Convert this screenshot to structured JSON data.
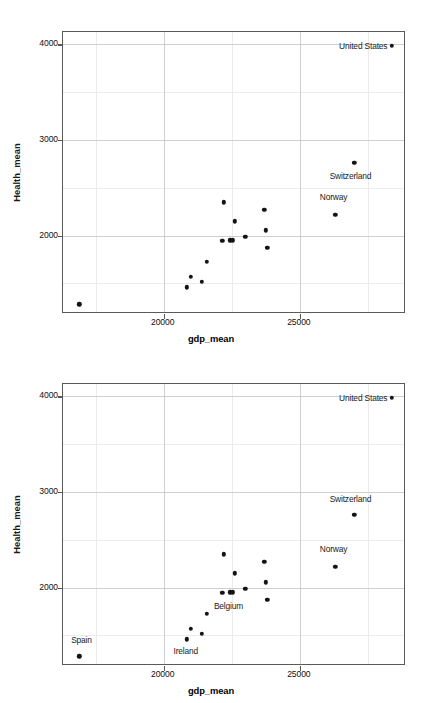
{
  "figure": {
    "panel_count": 2,
    "background": "#ffffff",
    "point_color": "#141414",
    "panel_border_color": "#5a5a5a",
    "grid_major_color": "#cfcfcf",
    "grid_minor_color": "#ebebeb"
  },
  "chart_data": [
    {
      "type": "scatter",
      "title": "",
      "xlabel": "gdp_mean",
      "ylabel": "Health_mean",
      "xlim": [
        16300,
        28900
      ],
      "ylim": [
        1180,
        4130
      ],
      "xticks": [
        20000,
        25000
      ],
      "xtick_labels": [
        "20000",
        "25000"
      ],
      "yticks": [
        2000,
        3000,
        4000
      ],
      "ytick_labels": [
        "2000",
        "3000",
        "4000"
      ],
      "x_minor_gridlines": [
        17500,
        22500,
        27500
      ],
      "y_minor_gridlines": [
        1500,
        2500,
        3500
      ],
      "grid": true,
      "legend": "none",
      "points": [
        {
          "label": "Spain",
          "x": 16900,
          "y": 1280,
          "shown": false,
          "lx": 0,
          "ly": 0
        },
        {
          "label": "Ireland",
          "x": 20840,
          "y": 1460,
          "shown": false,
          "lx": 0,
          "ly": 0
        },
        {
          "label": "Portugal",
          "x": 20990,
          "y": 1570,
          "shown": false,
          "lx": 0,
          "ly": 0
        },
        {
          "label": "Greece",
          "x": 21400,
          "y": 1515,
          "shown": false,
          "lx": 0,
          "ly": 0
        },
        {
          "label": "Italy",
          "x": 21590,
          "y": 1725,
          "shown": false,
          "lx": 0,
          "ly": 0
        },
        {
          "label": "Finland",
          "x": 22150,
          "y": 1945,
          "shown": false,
          "lx": 0,
          "ly": 0
        },
        {
          "label": "Belgium",
          "x": 22440,
          "y": 1950,
          "shown": false,
          "lx": 0,
          "ly": 0
        },
        {
          "label": "Japan",
          "x": 22530,
          "y": 1950,
          "shown": false,
          "lx": 0,
          "ly": 0
        },
        {
          "label": "Luxembourg",
          "x": 22200,
          "y": 2350,
          "shown": false,
          "lx": 0,
          "ly": 0
        },
        {
          "label": "Netherlands",
          "x": 22610,
          "y": 2150,
          "shown": false,
          "lx": 0,
          "ly": 0
        },
        {
          "label": "Austria",
          "x": 23000,
          "y": 1985,
          "shown": false,
          "lx": 0,
          "ly": 0
        },
        {
          "label": "Denmark",
          "x": 23700,
          "y": 2270,
          "shown": false,
          "lx": 0,
          "ly": 0
        },
        {
          "label": "Germany",
          "x": 23740,
          "y": 2055,
          "shown": false,
          "lx": 0,
          "ly": 0
        },
        {
          "label": "Sweden",
          "x": 23800,
          "y": 1870,
          "shown": false,
          "lx": 0,
          "ly": 0
        },
        {
          "label": "Norway",
          "x": 26300,
          "y": 2215,
          "shown": true,
          "lx": 26240,
          "ly": 2400
        },
        {
          "label": "Switzerland",
          "x": 27000,
          "y": 2760,
          "shown": true,
          "lx": 26860,
          "ly": 2620
        },
        {
          "label": "United States",
          "x": 28380,
          "y": 3985,
          "shown": true,
          "lx": 27330,
          "ly": 3985
        }
      ]
    },
    {
      "type": "scatter",
      "title": "",
      "xlabel": "gdp_mean",
      "ylabel": "Health_mean",
      "xlim": [
        16300,
        28900
      ],
      "ylim": [
        1180,
        4130
      ],
      "xticks": [
        20000,
        25000
      ],
      "xtick_labels": [
        "20000",
        "25000"
      ],
      "yticks": [
        2000,
        3000,
        4000
      ],
      "ytick_labels": [
        "2000",
        "3000",
        "4000"
      ],
      "x_minor_gridlines": [
        17500,
        22500,
        27500
      ],
      "y_minor_gridlines": [
        1500,
        2500,
        3500
      ],
      "grid": true,
      "legend": "none",
      "points": [
        {
          "label": "Spain",
          "x": 16900,
          "y": 1280,
          "shown": true,
          "lx": 16980,
          "ly": 1450
        },
        {
          "label": "Ireland",
          "x": 20840,
          "y": 1460,
          "shown": true,
          "lx": 20810,
          "ly": 1335
        },
        {
          "label": "Portugal",
          "x": 20990,
          "y": 1570,
          "shown": false,
          "lx": 0,
          "ly": 0
        },
        {
          "label": "Greece",
          "x": 21400,
          "y": 1515,
          "shown": false,
          "lx": 0,
          "ly": 0
        },
        {
          "label": "Italy",
          "x": 21590,
          "y": 1725,
          "shown": false,
          "lx": 0,
          "ly": 0
        },
        {
          "label": "Finland",
          "x": 22150,
          "y": 1945,
          "shown": false,
          "lx": 0,
          "ly": 0
        },
        {
          "label": "Belgium",
          "x": 22440,
          "y": 1950,
          "shown": true,
          "lx": 22380,
          "ly": 1810
        },
        {
          "label": "Japan",
          "x": 22530,
          "y": 1950,
          "shown": false,
          "lx": 0,
          "ly": 0
        },
        {
          "label": "Luxembourg",
          "x": 22200,
          "y": 2350,
          "shown": false,
          "lx": 0,
          "ly": 0
        },
        {
          "label": "Netherlands",
          "x": 22610,
          "y": 2150,
          "shown": false,
          "lx": 0,
          "ly": 0
        },
        {
          "label": "Austria",
          "x": 23000,
          "y": 1985,
          "shown": false,
          "lx": 0,
          "ly": 0
        },
        {
          "label": "Denmark",
          "x": 23700,
          "y": 2270,
          "shown": false,
          "lx": 0,
          "ly": 0
        },
        {
          "label": "Germany",
          "x": 23740,
          "y": 2055,
          "shown": false,
          "lx": 0,
          "ly": 0
        },
        {
          "label": "Sweden",
          "x": 23800,
          "y": 1870,
          "shown": false,
          "lx": 0,
          "ly": 0
        },
        {
          "label": "Norway",
          "x": 26300,
          "y": 2215,
          "shown": true,
          "lx": 26240,
          "ly": 2400
        },
        {
          "label": "Switzerland",
          "x": 27000,
          "y": 2760,
          "shown": true,
          "lx": 26860,
          "ly": 2925
        },
        {
          "label": "United States",
          "x": 28380,
          "y": 3985,
          "shown": true,
          "lx": 27330,
          "ly": 3985
        }
      ]
    }
  ]
}
